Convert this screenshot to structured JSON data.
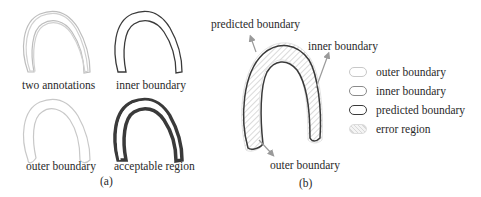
{
  "panel_a": {
    "caption": "(a)",
    "cells": [
      {
        "label": "two annotations"
      },
      {
        "label": "inner boundary"
      },
      {
        "label": "outer boundary"
      },
      {
        "label": "acceptable region"
      }
    ]
  },
  "panel_b": {
    "caption": "(b)",
    "callouts": {
      "predicted": "predicted boundary",
      "inner": "inner boundary",
      "outer": "outer boundary"
    },
    "legend": [
      {
        "label": "outer boundary",
        "border": "#c8c8c8",
        "fill": "#ffffff"
      },
      {
        "label": "inner boundary",
        "border": "#8a8a8a",
        "fill": "#ffffff"
      },
      {
        "label": "predicted boundary",
        "border": "#3a3a3a",
        "fill": "#ffffff"
      },
      {
        "label": "error region",
        "border": "#dcdcdc",
        "fill": "#f0f0f0"
      }
    ]
  },
  "colors": {
    "light_outline": "#bdbdbd",
    "dark_outline": "#3a3a3a",
    "arrow": "#9a9a9a",
    "hatch": "#b5b5b5"
  }
}
